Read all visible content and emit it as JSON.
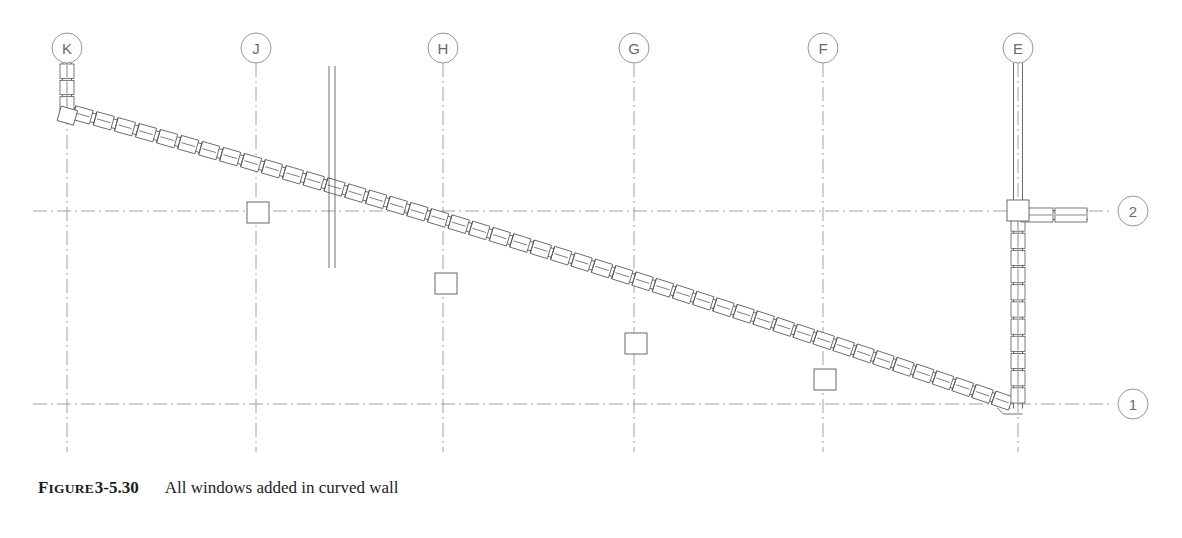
{
  "figure": {
    "label_prefix": "F",
    "label_rest": "IGURE",
    "number": "3-5.30",
    "caption": "All windows added in curved wall"
  },
  "drawing": {
    "type": "architectural-floor-plan",
    "background_color": "#ffffff",
    "line_color": "#58585a",
    "grid_color": "#8a8a8c",
    "bubble_text_color": "#6b6b6b",
    "width": 1182,
    "height": 538
  },
  "column_grid": {
    "vertical": [
      {
        "label": "K",
        "x": 67,
        "bubble_cy": 48,
        "line_top": 63,
        "line_bottom": 452
      },
      {
        "label": "J",
        "x": 256,
        "bubble_cy": 48,
        "line_top": 63,
        "line_bottom": 452
      },
      {
        "label": "H",
        "x": 443,
        "bubble_cy": 48,
        "line_top": 63,
        "line_bottom": 452
      },
      {
        "label": "G",
        "x": 634,
        "bubble_cy": 48,
        "line_top": 63,
        "line_bottom": 452
      },
      {
        "label": "F",
        "x": 823,
        "bubble_cy": 48,
        "line_top": 63,
        "line_bottom": 452
      },
      {
        "label": "E",
        "x": 1018,
        "bubble_cy": 48,
        "line_top": 63,
        "line_bottom": 452
      }
    ],
    "horizontal": [
      {
        "label": "2",
        "y": 211,
        "bubble_cx": 1133,
        "line_left": 33,
        "line_right": 1112
      },
      {
        "label": "1",
        "y": 404,
        "bubble_cx": 1133,
        "line_left": 33,
        "line_right": 1112
      }
    ],
    "bubble_radius": 15
  },
  "walls": {
    "curved_wall": {
      "name": "curved curtain wall",
      "start": {
        "x": 72,
        "y": 112
      },
      "end": {
        "x": 1012,
        "y": 404
      },
      "window_units": 46,
      "thickness": 9
    },
    "end_stub_k": {
      "name": "short wall at grid K",
      "x": 67,
      "top": 63,
      "bottom": 112,
      "window_units": 3
    },
    "vertical_wall_e": {
      "name": "wall on grid E",
      "x": 1018,
      "top": 63,
      "bottom": 404,
      "window_units": 11
    },
    "stub_row2": {
      "name": "wall stub at grid 2",
      "y": 215,
      "left": 1020,
      "right": 1088,
      "window_units": 2
    },
    "interior_wall": {
      "name": "interior partition wall",
      "x": 332,
      "top": 66,
      "bottom": 268
    }
  },
  "columns": [
    {
      "at_grid": "J",
      "x": 258,
      "y": 213
    },
    {
      "at_grid": "H",
      "x": 446,
      "y": 284
    },
    {
      "at_grid": "G",
      "x": 636,
      "y": 344
    },
    {
      "at_grid": "F",
      "x": 825,
      "y": 380
    },
    {
      "at_grid": "E-2",
      "x": 1018,
      "y": 211
    }
  ]
}
